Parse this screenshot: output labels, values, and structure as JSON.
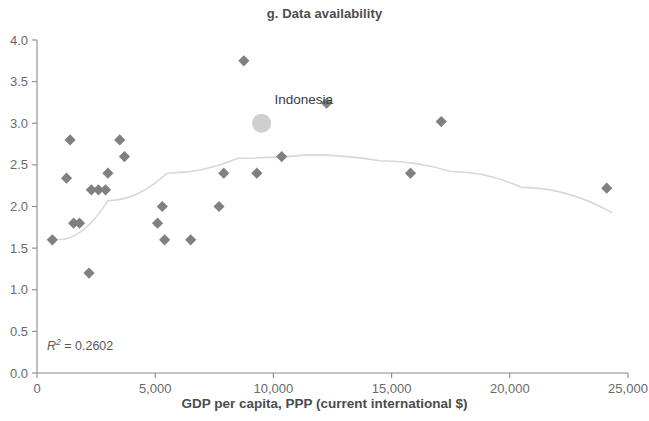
{
  "chart_data": {
    "type": "scatter",
    "title": "g. Data availability",
    "xlabel": "GDP per capita, PPP (current international $)",
    "ylabel": "",
    "xlim": [
      0,
      25000
    ],
    "ylim": [
      0,
      4.0
    ],
    "xticks": [
      0,
      5000,
      10000,
      15000,
      20000,
      25000
    ],
    "xtick_labels": [
      "0",
      "5,000",
      "10,000",
      "15,000",
      "20,000",
      "25,000"
    ],
    "yticks": [
      0.0,
      0.5,
      1.0,
      1.5,
      2.0,
      2.5,
      3.0,
      3.5,
      4.0
    ],
    "ytick_labels": [
      "0.0",
      "0.5",
      "1.0",
      "1.5",
      "2.0",
      "2.5",
      "3.0",
      "3.5",
      "4.0"
    ],
    "grid": false,
    "legend": null,
    "annotations": [
      {
        "text": "R2 = 0.2602",
        "display": "R² = 0.2602",
        "x": 900,
        "y": 0.42
      }
    ],
    "series": [
      {
        "name": "Countries",
        "marker": "diamond",
        "color": "#808083",
        "points": [
          {
            "x": 650,
            "y": 1.6
          },
          {
            "x": 1400,
            "y": 2.8
          },
          {
            "x": 1250,
            "y": 2.34
          },
          {
            "x": 1550,
            "y": 1.8
          },
          {
            "x": 1800,
            "y": 1.8
          },
          {
            "x": 2200,
            "y": 1.2
          },
          {
            "x": 2300,
            "y": 2.2
          },
          {
            "x": 2600,
            "y": 2.2
          },
          {
            "x": 2900,
            "y": 2.2
          },
          {
            "x": 3000,
            "y": 2.4
          },
          {
            "x": 3500,
            "y": 2.8
          },
          {
            "x": 3700,
            "y": 2.6
          },
          {
            "x": 5100,
            "y": 1.8
          },
          {
            "x": 5300,
            "y": 2.0
          },
          {
            "x": 5400,
            "y": 1.6
          },
          {
            "x": 6500,
            "y": 1.6
          },
          {
            "x": 7700,
            "y": 2.0
          },
          {
            "x": 7900,
            "y": 2.4
          },
          {
            "x": 8750,
            "y": 3.75
          },
          {
            "x": 9300,
            "y": 2.4
          },
          {
            "x": 10350,
            "y": 2.6
          },
          {
            "x": 12250,
            "y": 3.24
          },
          {
            "x": 15800,
            "y": 2.4
          },
          {
            "x": 17100,
            "y": 3.02
          },
          {
            "x": 24100,
            "y": 2.22
          }
        ]
      },
      {
        "name": "Indonesia",
        "marker": "circle",
        "color": "#cfcfd1",
        "points": [
          {
            "x": 9500,
            "y": 3.0,
            "label": "Indonesia"
          }
        ]
      }
    ],
    "trendline": {
      "type": "polynomial",
      "order": 2,
      "color": "#d8d8da",
      "r_squared": 0.2602,
      "path_points": [
        {
          "x": 900,
          "y": 1.6
        },
        {
          "x": 3000,
          "y": 2.07
        },
        {
          "x": 5500,
          "y": 2.4
        },
        {
          "x": 8500,
          "y": 2.58
        },
        {
          "x": 11500,
          "y": 2.62
        },
        {
          "x": 14500,
          "y": 2.55
        },
        {
          "x": 17500,
          "y": 2.42
        },
        {
          "x": 20500,
          "y": 2.23
        },
        {
          "x": 24300,
          "y": 1.93
        }
      ]
    }
  },
  "labels": {
    "indonesia": "Indonesia"
  }
}
